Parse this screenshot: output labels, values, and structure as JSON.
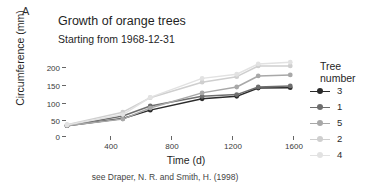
{
  "panel": {
    "label": "A"
  },
  "header": {
    "title": "Growth of orange trees",
    "subtitle": "Starting from 1968-12-31"
  },
  "caption": {
    "text": "see Draper, N. R. and Smith, H. (1998)"
  },
  "legend": {
    "title_line1": "Tree",
    "title_line2": "number",
    "entries": [
      {
        "label": "3",
        "color": "#2b2b2b"
      },
      {
        "label": "1",
        "color": "#6e6e6e"
      },
      {
        "label": "5",
        "color": "#a8a8a8"
      },
      {
        "label": "2",
        "color": "#cfcfcf"
      },
      {
        "label": "4",
        "color": "#e2e2e2"
      }
    ]
  },
  "chart_data": {
    "type": "line",
    "title": "Growth of orange trees",
    "subtitle": "Starting from 1968-12-31",
    "caption": "see Draper, N. R. and Smith, H. (1998)",
    "xlabel": "Time (d)",
    "ylabel": "Circumference (mm)",
    "legend_title": "Tree number",
    "legend_position": "right",
    "grid": false,
    "x": [
      118,
      484,
      664,
      1004,
      1231,
      1372,
      1582
    ],
    "xlim": [
      0,
      1700
    ],
    "ylim": [
      0,
      230
    ],
    "xticks": [
      400,
      800,
      1200,
      1600
    ],
    "yticks": [
      0,
      50,
      100,
      150,
      200
    ],
    "series": [
      {
        "name": "3",
        "color": "#2b2b2b",
        "values": [
          30,
          51,
          75,
          108,
          115,
          139,
          140
        ]
      },
      {
        "name": "1",
        "color": "#6e6e6e",
        "values": [
          30,
          58,
          87,
          115,
          120,
          142,
          145
        ]
      },
      {
        "name": "5",
        "color": "#a8a8a8",
        "values": [
          30,
          49,
          81,
          125,
          142,
          174,
          177
        ]
      },
      {
        "name": "2",
        "color": "#cfcfcf",
        "values": [
          33,
          69,
          111,
          156,
          172,
          203,
          203
        ]
      },
      {
        "name": "4",
        "color": "#e2e2e2",
        "values": [
          32,
          62,
          112,
          167,
          179,
          209,
          214
        ]
      }
    ]
  }
}
